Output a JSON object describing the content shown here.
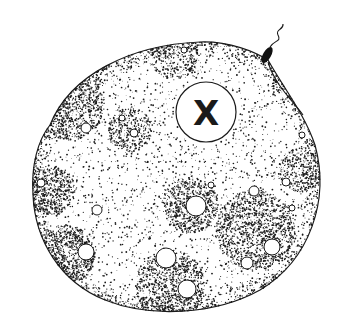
{
  "figure": {
    "nucleus_label": "X",
    "colors": {
      "ink": "#1a1a1a",
      "background": "#ffffff"
    }
  },
  "cell": {
    "outline_path": "M 50 125 C 70 75, 130 45, 200 42 C 230 41, 255 52, 268 60 C 285 90, 305 115, 315 145 C 330 200, 310 260, 260 290 C 215 315, 150 318, 105 300 C 60 282, 35 240, 33 195 C 31 165, 38 140, 50 125 Z",
    "vacuoles": [
      {
        "cx": 86,
        "cy": 128,
        "r": 5
      },
      {
        "cx": 122,
        "cy": 118,
        "r": 3
      },
      {
        "cx": 134,
        "cy": 133,
        "r": 4
      },
      {
        "cx": 184,
        "cy": 50,
        "r": 3
      },
      {
        "cx": 41,
        "cy": 183,
        "r": 4
      },
      {
        "cx": 97,
        "cy": 210,
        "r": 5
      },
      {
        "cx": 196,
        "cy": 206,
        "r": 10
      },
      {
        "cx": 254,
        "cy": 191,
        "r": 5
      },
      {
        "cx": 286,
        "cy": 182,
        "r": 4
      },
      {
        "cx": 302,
        "cy": 135,
        "r": 3
      },
      {
        "cx": 86,
        "cy": 252,
        "r": 8
      },
      {
        "cx": 166,
        "cy": 258,
        "r": 10
      },
      {
        "cx": 187,
        "cy": 289,
        "r": 9
      },
      {
        "cx": 247,
        "cy": 263,
        "r": 6
      },
      {
        "cx": 272,
        "cy": 247,
        "r": 8
      },
      {
        "cx": 211,
        "cy": 185,
        "r": 3
      },
      {
        "cx": 292,
        "cy": 208,
        "r": 3
      }
    ],
    "nucleus": {
      "cx": 206,
      "cy": 112,
      "r": 30
    }
  },
  "flagellum": {
    "body": {
      "cx": 267,
      "cy": 55,
      "rx": 4,
      "ry": 9,
      "rotate": 30
    },
    "tail_path": "M 270 47 C 274 40, 282 42, 278 35 C 275 29, 284 30, 283 24",
    "strand_path": "M 268 62 C 275 85, 292 100, 303 115"
  },
  "stipple": {
    "seed": 7,
    "count": 3200,
    "dense_regions": [
      {
        "cx": 70,
        "cy": 105,
        "r": 35,
        "w": 1.4
      },
      {
        "cx": 50,
        "cy": 190,
        "r": 25,
        "w": 1.6
      },
      {
        "cx": 65,
        "cy": 255,
        "r": 30,
        "w": 1.8
      },
      {
        "cx": 130,
        "cy": 130,
        "r": 22,
        "w": 1.3
      },
      {
        "cx": 190,
        "cy": 205,
        "r": 28,
        "w": 1.5
      },
      {
        "cx": 170,
        "cy": 285,
        "r": 35,
        "w": 1.5
      },
      {
        "cx": 255,
        "cy": 230,
        "r": 40,
        "w": 1.4
      },
      {
        "cx": 300,
        "cy": 170,
        "r": 22,
        "w": 1.3
      },
      {
        "cx": 175,
        "cy": 55,
        "r": 25,
        "w": 1.0
      }
    ]
  }
}
